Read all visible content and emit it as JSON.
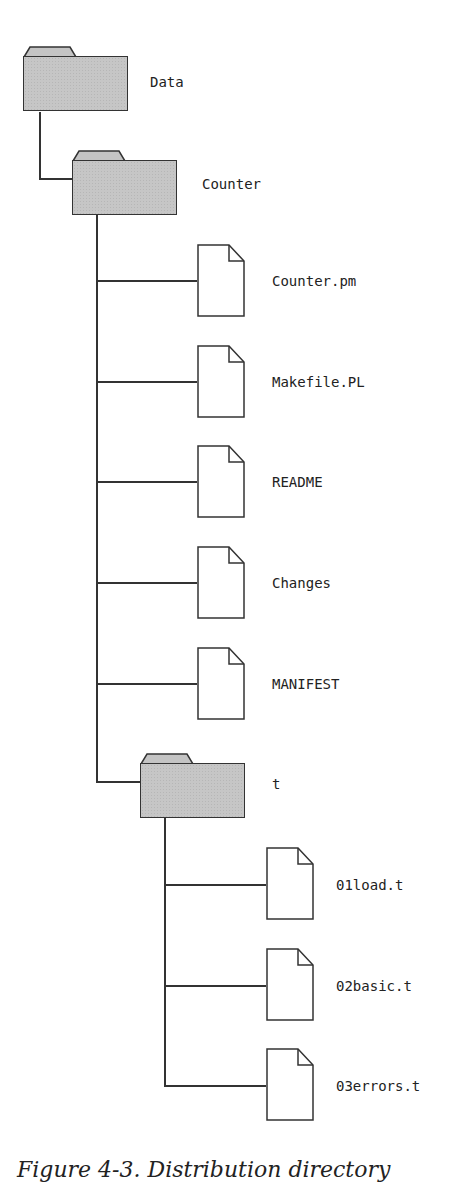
{
  "diagram": {
    "type": "directory-tree",
    "root": {
      "name": "Data",
      "kind": "folder",
      "children": [
        {
          "name": "Counter",
          "kind": "folder",
          "children": [
            {
              "name": "Counter.pm",
              "kind": "file"
            },
            {
              "name": "Makefile.PL",
              "kind": "file"
            },
            {
              "name": "README",
              "kind": "file"
            },
            {
              "name": "Changes",
              "kind": "file"
            },
            {
              "name": "MANIFEST",
              "kind": "file"
            },
            {
              "name": "t",
              "kind": "folder",
              "children": [
                {
                  "name": "01load.t",
                  "kind": "file"
                },
                {
                  "name": "02basic.t",
                  "kind": "file"
                },
                {
                  "name": "03errors.t",
                  "kind": "file"
                }
              ]
            }
          ]
        }
      ]
    }
  },
  "labels": {
    "data": "Data",
    "counter": "Counter",
    "counter_pm": "Counter.pm",
    "makefile": "Makefile.PL",
    "readme": "README",
    "changes": "Changes",
    "manifest": "MANIFEST",
    "t": "t",
    "load": "01load.t",
    "basic": "02basic.t",
    "errors": "03errors.t"
  },
  "caption": "Figure 4-3. Distribution directory",
  "colors": {
    "folder_fill": "#c6c6c6",
    "stroke": "#333333",
    "background": "#ffffff"
  }
}
